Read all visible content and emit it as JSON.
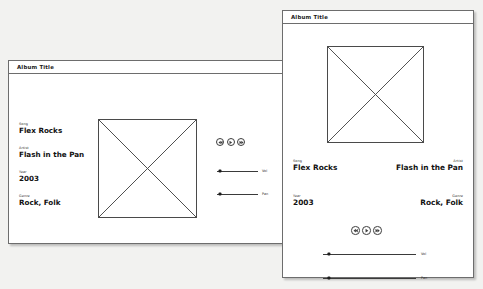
{
  "background_color": "#f2f2f0",
  "panel_color": "#ffffff",
  "line_color": "#4a4a4a",
  "panels": [
    {
      "name": "left-panel",
      "title": "Album Title",
      "artwork": {
        "placeholder_icon": "image-placeholder-x-box"
      },
      "fields": [
        {
          "label": "Song",
          "value": "Flex Rocks"
        },
        {
          "label": "Artist",
          "value": "Flash in the Pan"
        },
        {
          "label": "Year",
          "value": "2003"
        },
        {
          "label": "Genre",
          "value": "Rock, Folk"
        }
      ],
      "transport": [
        {
          "icon": "rewind-icon",
          "name": "previous-track-button"
        },
        {
          "icon": "play-icon",
          "name": "play-button"
        },
        {
          "icon": "forward-icon",
          "name": "next-track-button"
        }
      ],
      "sliders": [
        {
          "label": "Vol",
          "value": 8
        },
        {
          "label": "Pan",
          "value": 8
        }
      ]
    },
    {
      "name": "right-panel",
      "title": "Album Title",
      "artwork": {
        "placeholder_icon": "image-placeholder-x-box"
      },
      "fields": [
        {
          "label": "Song",
          "value": "Flex Rocks"
        },
        {
          "label": "Artist",
          "value": "Flash in the Pan"
        },
        {
          "label": "Year",
          "value": "2003"
        },
        {
          "label": "Genre",
          "value": "Rock, Folk"
        }
      ],
      "transport": [
        {
          "icon": "rewind-icon",
          "name": "previous-track-button"
        },
        {
          "icon": "play-icon",
          "name": "play-button"
        },
        {
          "icon": "forward-icon",
          "name": "next-track-button"
        }
      ],
      "sliders": [
        {
          "label": "Vol",
          "value": 6
        },
        {
          "label": "Pan",
          "value": 6
        }
      ]
    }
  ]
}
